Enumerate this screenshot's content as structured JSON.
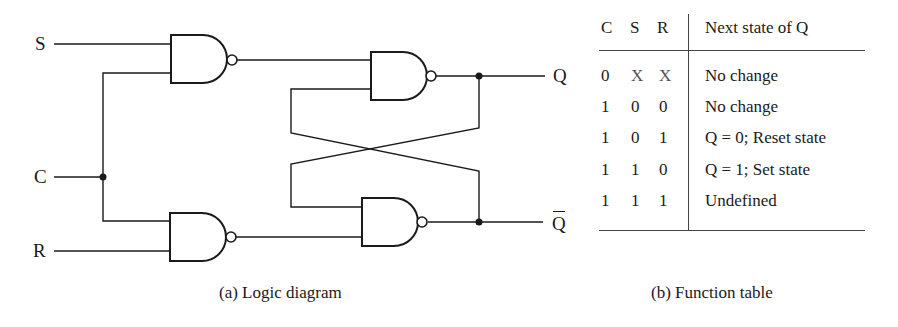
{
  "diagram": {
    "inputs": {
      "s": "S",
      "c": "C",
      "r": "R"
    },
    "outputs": {
      "q": "Q",
      "q_bar": "Q"
    },
    "gates": [
      {
        "id": "gate-1",
        "type": "NAND",
        "inputs": [
          "S",
          "C"
        ]
      },
      {
        "id": "gate-2",
        "type": "NAND",
        "inputs": [
          "C",
          "R"
        ]
      },
      {
        "id": "gate-3",
        "type": "NAND",
        "inputs": [
          "gate-1",
          "Q-bar"
        ],
        "output": "Q"
      },
      {
        "id": "gate-4",
        "type": "NAND",
        "inputs": [
          "Q",
          "gate-2"
        ],
        "output": "Q-bar"
      }
    ],
    "caption": "(a) Logic diagram"
  },
  "function_table": {
    "headers": [
      "C",
      "S",
      "R",
      "Next state of Q"
    ],
    "rows": [
      {
        "c": "0",
        "s": "X",
        "r": "X",
        "next": "No change"
      },
      {
        "c": "1",
        "s": "0",
        "r": "0",
        "next": "No change"
      },
      {
        "c": "1",
        "s": "0",
        "r": "1",
        "next": "Q = 0; Reset state"
      },
      {
        "c": "1",
        "s": "1",
        "r": "0",
        "next": "Q = 1; Set state"
      },
      {
        "c": "1",
        "s": "1",
        "r": "1",
        "next": "Undefined"
      }
    ],
    "caption": "(b) Function table"
  }
}
